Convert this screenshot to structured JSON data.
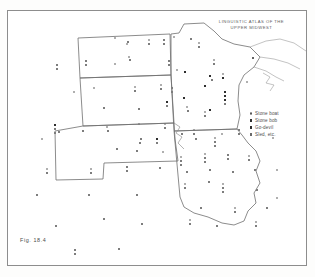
{
  "figure": {
    "label": "Fig. 18.4",
    "title_line1": "LINGUISTIC ATLAS OF THE",
    "title_line2": "UPPER MIDWEST"
  },
  "legend": {
    "entries": [
      {
        "label": "Stone boat",
        "symbol": "open-circle"
      },
      {
        "label": "Stone bob",
        "symbol": "filled-square"
      },
      {
        "label": "Go-devil",
        "symbol": "filled-square"
      },
      {
        "label": "Sled, etc.",
        "symbol": "open-square"
      }
    ]
  },
  "colors": {
    "ink": "#2e2e2e",
    "line": "#6f6f6f",
    "water": "#9a9a9a",
    "paper": "#ffffff",
    "frame": "#8d8d8d"
  },
  "map": {
    "region": "Upper Midwest",
    "states": [
      "North Dakota",
      "South Dakota",
      "Nebraska",
      "Minnesota",
      "Iowa"
    ],
    "water_features": [
      "Lake Superior"
    ],
    "outlines": {
      "north_dakota": "M 70,27 L 162,23 L 163,64 L 72,67 Z",
      "south_dakota": "M 72,67 L 163,64 L 166,112 L 75,115 Z",
      "nebraska": "M 75,115 L 166,112 L 168,150 L 96,152 L 95,168 L 48,169 L 47,120 Z",
      "minnesota": "M 163,23 L 206,20 L 222,34 L 246,36 L 258,54 L 232,72 L 230,118 L 166,120 L 163,64 Z",
      "iowa": "M 166,120 L 230,118 L 248,150 L 246,186 L 172,189 Z",
      "lake_superior": "M 246,36 L 278,32 L 300,40 L 296,58 L 262,62 L 244,52 Z"
    },
    "point_symbols": {
      "open_circle": "Stone boat",
      "filled_square_a": "Stone bob",
      "filled_square_b": "Go-devil",
      "open_square": "Sled, etc."
    },
    "points": [
      {
        "x": 106,
        "y": 26,
        "t": "ocirc"
      },
      {
        "x": 119,
        "y": 30,
        "t": "osq"
      },
      {
        "x": 165,
        "y": 25,
        "t": "ocirc"
      },
      {
        "x": 182,
        "y": 27,
        "t": "osq"
      },
      {
        "x": 190,
        "y": 31,
        "t": "ocirc"
      },
      {
        "x": 190,
        "y": 35,
        "t": "osq"
      },
      {
        "x": 77,
        "y": 49,
        "t": "osq"
      },
      {
        "x": 77,
        "y": 53,
        "t": "osq"
      },
      {
        "x": 118,
        "y": 32,
        "t": "ocirc"
      },
      {
        "x": 155,
        "y": 28,
        "t": "osq"
      },
      {
        "x": 155,
        "y": 32,
        "t": "osq"
      },
      {
        "x": 140,
        "y": 28,
        "t": "ocirc"
      },
      {
        "x": 140,
        "y": 32,
        "t": "osq"
      },
      {
        "x": 120,
        "y": 45,
        "t": "ocirc"
      },
      {
        "x": 121,
        "y": 48,
        "t": "osq"
      },
      {
        "x": 106,
        "y": 52,
        "t": "ocirc"
      },
      {
        "x": 126,
        "y": 75,
        "t": "ocirc"
      },
      {
        "x": 126,
        "y": 79,
        "t": "osq"
      },
      {
        "x": 152,
        "y": 73,
        "t": "ocirc"
      },
      {
        "x": 152,
        "y": 77,
        "t": "osq"
      },
      {
        "x": 163,
        "y": 76,
        "t": "osq"
      },
      {
        "x": 163,
        "y": 80,
        "t": "osq"
      },
      {
        "x": 85,
        "y": 76,
        "t": "ocirc"
      },
      {
        "x": 65,
        "y": 80,
        "t": "ocirc"
      },
      {
        "x": 158,
        "y": 90,
        "t": "fsq"
      },
      {
        "x": 158,
        "y": 94,
        "t": "osq"
      },
      {
        "x": 95,
        "y": 96,
        "t": "osq"
      },
      {
        "x": 130,
        "y": 97,
        "t": "osq"
      },
      {
        "x": 48,
        "y": 53,
        "t": "osq"
      },
      {
        "x": 48,
        "y": 57,
        "t": "osq"
      },
      {
        "x": 46,
        "y": 113,
        "t": "fsq"
      },
      {
        "x": 46,
        "y": 117,
        "t": "osq"
      },
      {
        "x": 46,
        "y": 121,
        "t": "osq"
      },
      {
        "x": 74,
        "y": 119,
        "t": "osq"
      },
      {
        "x": 98,
        "y": 115,
        "t": "ocirc"
      },
      {
        "x": 99,
        "y": 119,
        "t": "osq"
      },
      {
        "x": 130,
        "y": 112,
        "t": "ocirc"
      },
      {
        "x": 132,
        "y": 127,
        "t": "osq"
      },
      {
        "x": 131,
        "y": 131,
        "t": "osq"
      },
      {
        "x": 33,
        "y": 127,
        "t": "ocirc"
      },
      {
        "x": 108,
        "y": 137,
        "t": "osq"
      },
      {
        "x": 128,
        "y": 139,
        "t": "osq"
      },
      {
        "x": 50,
        "y": 120,
        "t": "osq"
      },
      {
        "x": 156,
        "y": 112,
        "t": "ocirc"
      },
      {
        "x": 156,
        "y": 116,
        "t": "osq"
      },
      {
        "x": 154,
        "y": 140,
        "t": "ocirc"
      },
      {
        "x": 38,
        "y": 157,
        "t": "ocirc"
      },
      {
        "x": 38,
        "y": 161,
        "t": "osq"
      },
      {
        "x": 28,
        "y": 183,
        "t": "osq"
      },
      {
        "x": 82,
        "y": 157,
        "t": "ocirc"
      },
      {
        "x": 82,
        "y": 161,
        "t": "osq"
      },
      {
        "x": 80,
        "y": 183,
        "t": "osq"
      },
      {
        "x": 118,
        "y": 155,
        "t": "osq"
      },
      {
        "x": 118,
        "y": 159,
        "t": "osq"
      },
      {
        "x": 128,
        "y": 183,
        "t": "osq"
      },
      {
        "x": 47,
        "y": 214,
        "t": "osq"
      },
      {
        "x": 95,
        "y": 207,
        "t": "osq"
      },
      {
        "x": 133,
        "y": 212,
        "t": "osq"
      },
      {
        "x": 110,
        "y": 237,
        "t": "osq"
      },
      {
        "x": 66,
        "y": 238,
        "t": "osq"
      },
      {
        "x": 66,
        "y": 242,
        "t": "osq"
      },
      {
        "x": 151,
        "y": 156,
        "t": "osq"
      },
      {
        "x": 148,
        "y": 127,
        "t": "fsq"
      },
      {
        "x": 148,
        "y": 131,
        "t": "osq"
      },
      {
        "x": 168,
        "y": 58,
        "t": "ocirc"
      },
      {
        "x": 176,
        "y": 60,
        "t": "fsq"
      },
      {
        "x": 175,
        "y": 86,
        "t": "fsq"
      },
      {
        "x": 178,
        "y": 95,
        "t": "ocirc"
      },
      {
        "x": 179,
        "y": 99,
        "t": "osq"
      },
      {
        "x": 201,
        "y": 64,
        "t": "fsq"
      },
      {
        "x": 203,
        "y": 68,
        "t": "osq"
      },
      {
        "x": 196,
        "y": 74,
        "t": "fsq"
      },
      {
        "x": 214,
        "y": 62,
        "t": "ocirc"
      },
      {
        "x": 214,
        "y": 66,
        "t": "fsq"
      },
      {
        "x": 216,
        "y": 80,
        "t": "fsq"
      },
      {
        "x": 216,
        "y": 84,
        "t": "fsq"
      },
      {
        "x": 216,
        "y": 88,
        "t": "fsq"
      },
      {
        "x": 216,
        "y": 92,
        "t": "osq"
      },
      {
        "x": 196,
        "y": 100,
        "t": "ocirc"
      },
      {
        "x": 196,
        "y": 104,
        "t": "osq"
      },
      {
        "x": 201,
        "y": 98,
        "t": "fsq"
      },
      {
        "x": 205,
        "y": 48,
        "t": "ocirc"
      },
      {
        "x": 205,
        "y": 52,
        "t": "osq"
      },
      {
        "x": 244,
        "y": 46,
        "t": "fcirc"
      },
      {
        "x": 238,
        "y": 70,
        "t": "ocirc"
      },
      {
        "x": 185,
        "y": 118,
        "t": "ocirc"
      },
      {
        "x": 185,
        "y": 122,
        "t": "osq"
      },
      {
        "x": 187,
        "y": 127,
        "t": "osq"
      },
      {
        "x": 173,
        "y": 122,
        "t": "osq"
      },
      {
        "x": 206,
        "y": 126,
        "t": "ocirc"
      },
      {
        "x": 206,
        "y": 130,
        "t": "osq"
      },
      {
        "x": 206,
        "y": 134,
        "t": "osq"
      },
      {
        "x": 213,
        "y": 122,
        "t": "ocirc"
      },
      {
        "x": 230,
        "y": 118,
        "t": "osq"
      },
      {
        "x": 230,
        "y": 122,
        "t": "osq"
      },
      {
        "x": 172,
        "y": 145,
        "t": "ocirc"
      },
      {
        "x": 172,
        "y": 149,
        "t": "osq"
      },
      {
        "x": 172,
        "y": 153,
        "t": "osq"
      },
      {
        "x": 196,
        "y": 142,
        "t": "ocirc"
      },
      {
        "x": 196,
        "y": 146,
        "t": "osq"
      },
      {
        "x": 196,
        "y": 150,
        "t": "osq"
      },
      {
        "x": 219,
        "y": 143,
        "t": "osq"
      },
      {
        "x": 219,
        "y": 147,
        "t": "osq"
      },
      {
        "x": 240,
        "y": 144,
        "t": "ocirc"
      },
      {
        "x": 240,
        "y": 148,
        "t": "osq"
      },
      {
        "x": 178,
        "y": 160,
        "t": "osq"
      },
      {
        "x": 201,
        "y": 158,
        "t": "osq"
      },
      {
        "x": 224,
        "y": 160,
        "t": "osq"
      },
      {
        "x": 246,
        "y": 158,
        "t": "osq"
      },
      {
        "x": 176,
        "y": 172,
        "t": "ocirc"
      },
      {
        "x": 176,
        "y": 176,
        "t": "osq"
      },
      {
        "x": 200,
        "y": 170,
        "t": "osq"
      },
      {
        "x": 214,
        "y": 172,
        "t": "ocirc"
      },
      {
        "x": 214,
        "y": 176,
        "t": "osq"
      },
      {
        "x": 214,
        "y": 180,
        "t": "osq"
      },
      {
        "x": 248,
        "y": 178,
        "t": "osq"
      },
      {
        "x": 192,
        "y": 196,
        "t": "osq"
      },
      {
        "x": 226,
        "y": 196,
        "t": "ocirc"
      },
      {
        "x": 226,
        "y": 200,
        "t": "osq"
      },
      {
        "x": 258,
        "y": 196,
        "t": "osq"
      },
      {
        "x": 181,
        "y": 208,
        "t": "ocirc"
      },
      {
        "x": 181,
        "y": 212,
        "t": "osq"
      },
      {
        "x": 208,
        "y": 214,
        "t": "osq"
      },
      {
        "x": 247,
        "y": 210,
        "t": "ocirc"
      },
      {
        "x": 247,
        "y": 214,
        "t": "osq"
      },
      {
        "x": 268,
        "y": 186,
        "t": "ocirc"
      },
      {
        "x": 268,
        "y": 158,
        "t": "ocirc"
      },
      {
        "x": 264,
        "y": 126,
        "t": "ocirc"
      },
      {
        "x": 160,
        "y": 49,
        "t": "osq"
      },
      {
        "x": 160,
        "y": 53,
        "t": "osq"
      }
    ]
  }
}
